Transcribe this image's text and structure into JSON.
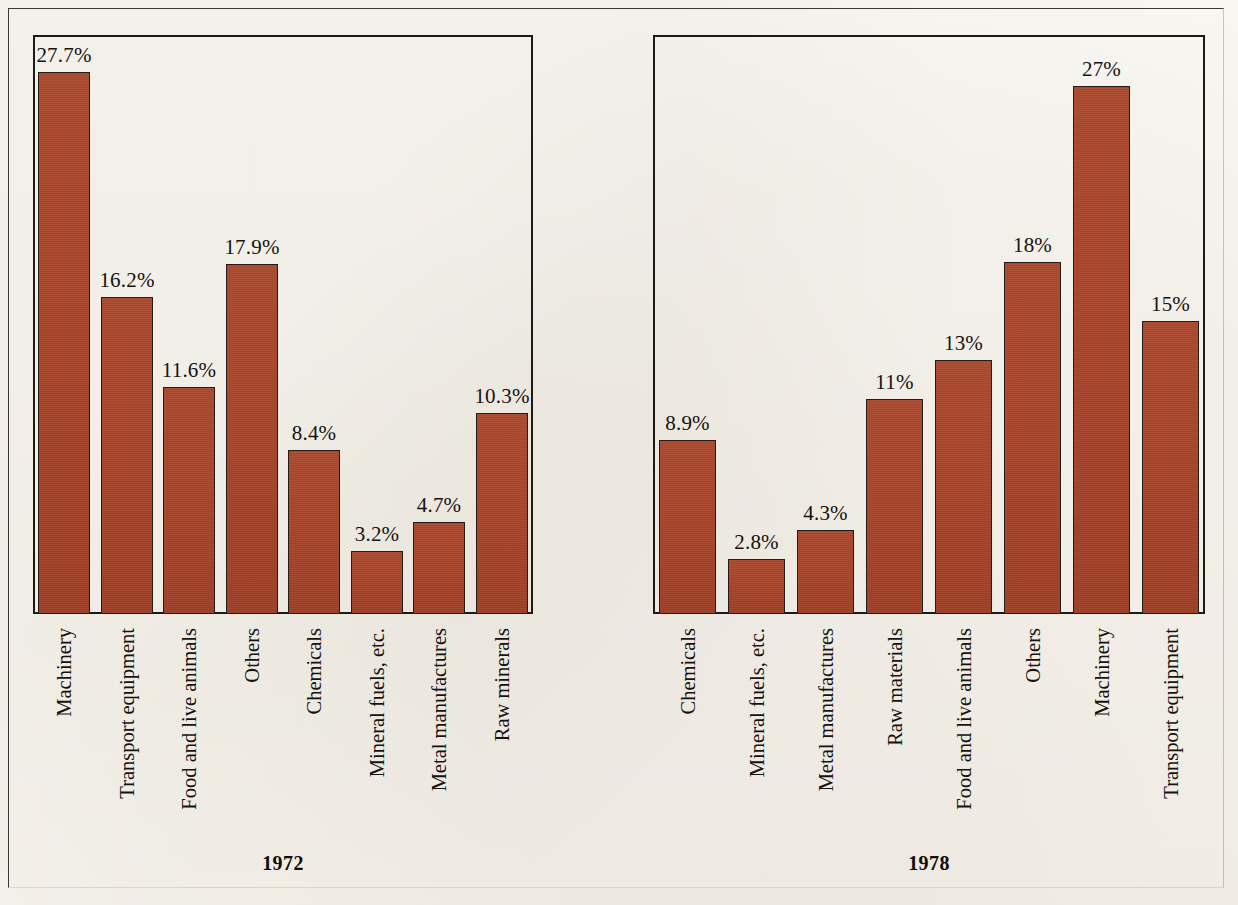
{
  "figure": {
    "background_color": "#f7f5f0",
    "bar_color": "#a8452b",
    "bar_outline_color": "#241c16",
    "frame_color": "#1d1a17",
    "text_color": "#15120f"
  },
  "panels": [
    {
      "key": "panel_1972",
      "caption": "1972",
      "categories": [
        "Machinery",
        "Transport equipment",
        "Food and live animals",
        "Others",
        "Chemicals",
        "Mineral fuels, etc.",
        "Metal manufactures",
        "Raw minerals"
      ],
      "values": [
        27.7,
        16.2,
        11.6,
        17.9,
        8.4,
        3.2,
        4.7,
        10.3
      ],
      "value_labels": [
        "27.7%",
        "16.2%",
        "11.6%",
        "17.9%",
        "8.4%",
        "3.2%",
        "4.7%",
        "10.3%"
      ]
    },
    {
      "key": "panel_1978",
      "caption": "1978",
      "categories": [
        "Chemicals",
        "Mineral fuels, etc.",
        "Metal manufactures",
        "Raw materials",
        "Food and live animals",
        "Others",
        "Machinery",
        "Transport equipment"
      ],
      "values": [
        8.9,
        2.8,
        4.3,
        11,
        13,
        18,
        27,
        15
      ],
      "value_labels": [
        "8.9%",
        "2.8%",
        "4.3%",
        "11%",
        "13%",
        "18%",
        "27%",
        "15%"
      ]
    }
  ],
  "chart_data": {
    "type": "bar",
    "title": "",
    "subtitle": "",
    "xlabel": "",
    "ylabel": "",
    "ylim": [
      0,
      29
    ],
    "grid": false,
    "legend": "none",
    "units": "percent",
    "panels": [
      {
        "name": "1972",
        "categories": [
          "Machinery",
          "Transport equipment",
          "Food and live animals",
          "Others",
          "Chemicals",
          "Mineral fuels, etc.",
          "Metal manufactures",
          "Raw minerals"
        ],
        "values": [
          27.7,
          16.2,
          11.6,
          17.9,
          8.4,
          3.2,
          4.7,
          10.3
        ],
        "data_labels": [
          "27.7%",
          "16.2%",
          "11.6%",
          "17.9%",
          "8.4%",
          "3.2%",
          "4.7%",
          "10.3%"
        ]
      },
      {
        "name": "1978",
        "categories": [
          "Chemicals",
          "Mineral fuels, etc.",
          "Metal manufactures",
          "Raw materials",
          "Food and live animals",
          "Others",
          "Machinery",
          "Transport equipment"
        ],
        "values": [
          8.9,
          2.8,
          4.3,
          11,
          13,
          18,
          27,
          15
        ],
        "data_labels": [
          "8.9%",
          "2.8%",
          "4.3%",
          "11%",
          "13%",
          "18%",
          "27%",
          "15%"
        ]
      }
    ]
  }
}
